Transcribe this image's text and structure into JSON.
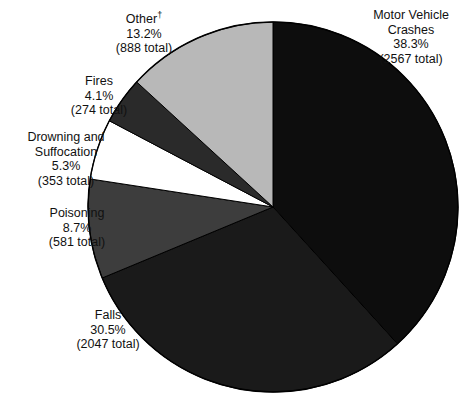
{
  "chart_data": {
    "type": "pie",
    "title": "",
    "subtitle": "",
    "xlabel": "",
    "ylabel": "",
    "legend_position": "none",
    "grid": false,
    "start_angle_deg": 0,
    "direction": "clockwise",
    "center": {
      "x": 273,
      "y": 207
    },
    "radius": 185,
    "total": 6710,
    "categories": [
      "Motor Vehicle Crashes",
      "Falls",
      "Other",
      "Poisoning",
      "Drowning and Suffocation",
      "Fires"
    ],
    "values": [
      38.3,
      30.5,
      13.2,
      8.7,
      5.3,
      4.1
    ],
    "counts": [
      2567,
      2047,
      888,
      581,
      353,
      274
    ],
    "slices": [
      {
        "id": "motor-vehicle-crashes",
        "name": "Motor Vehicle Crashes",
        "percent": 38.3,
        "percent_text": "38.3%",
        "count": 2567,
        "count_text": "(2567 total)",
        "color": "#0d0d0d",
        "name_lines": [
          "Motor Vehicle",
          "Crashes"
        ],
        "dagger": false
      },
      {
        "id": "falls",
        "name": "Falls",
        "percent": 30.5,
        "percent_text": "30.5%",
        "count": 2047,
        "count_text": "(2047 total)",
        "color": "#1a1a1a",
        "name_lines": [
          "Falls"
        ],
        "dagger": false
      },
      {
        "id": "poisoning",
        "name": "Poisoning",
        "percent": 8.7,
        "percent_text": "8.7%",
        "count": 581,
        "count_text": "(581 total)",
        "color": "#3d3d3d",
        "name_lines": [
          "Poisoning"
        ],
        "dagger": false
      },
      {
        "id": "drowning-suffocation",
        "name": "Drowning and Suffocation",
        "percent": 5.3,
        "percent_text": "5.3%",
        "count": 353,
        "count_text": "(353 total)",
        "color": "#ffffff",
        "name_lines": [
          "Drowning and",
          "Suffocation"
        ],
        "dagger": false
      },
      {
        "id": "fires",
        "name": "Fires",
        "percent": 4.1,
        "percent_text": "4.1%",
        "count": 274,
        "count_text": "(274 total)",
        "color": "#2a2a2a",
        "name_lines": [
          "Fires"
        ],
        "dagger": false
      },
      {
        "id": "other",
        "name": "Other",
        "percent": 13.2,
        "percent_text": "13.2%",
        "count": 888,
        "count_text": "(888 total)",
        "color": "#b8b8b8",
        "name_lines": [
          "Other"
        ],
        "dagger": true,
        "dagger_symbol": "†"
      }
    ],
    "colors": {
      "motor_vehicle_crashes": "#0d0d0d",
      "falls": "#1a1a1a",
      "poisoning": "#3d3d3d",
      "drowning_suffocation": "#ffffff",
      "fires": "#2a2a2a",
      "other": "#b8b8b8",
      "outline": "#000000",
      "background": "#ffffff"
    }
  },
  "labels": {
    "motor_vehicle_crashes": {
      "line1": "Motor Vehicle",
      "line2": "Crashes",
      "line3": "38.3%",
      "line4": "(2567 total)"
    },
    "other": {
      "line1": "Other",
      "dagger": "†",
      "line2": "13.2%",
      "line3": "(888 total)"
    },
    "fires": {
      "line1": "Fires",
      "line2": "4.1%",
      "line3": "(274 total)"
    },
    "drowning_suffocation": {
      "line1": "Drowning and",
      "line2": "Suffocation",
      "line3": "5.3%",
      "line4": "(353 total)"
    },
    "poisoning": {
      "line1": "Poisoning",
      "line2": "8.7%",
      "line3": "(581 total)"
    },
    "falls": {
      "line1": "Falls",
      "line2": "30.5%",
      "line3": "(2047 total)"
    }
  }
}
